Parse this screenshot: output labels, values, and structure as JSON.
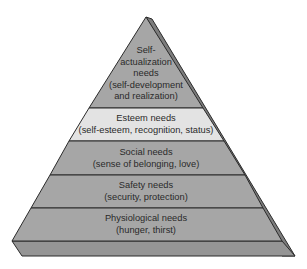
{
  "diagram": {
    "type": "pyramid",
    "colors": {
      "level_fill": "#a6a6a6",
      "esteem_fill": "#e3e3e3",
      "side_face": "#7d7d7d",
      "base_slab": "#959595",
      "outline": "#2b2b2b",
      "text": "#2a2a2a"
    },
    "levels": [
      {
        "name": "self-actualization",
        "lines": [
          "Self-",
          "actualization",
          "needs",
          "(self-development",
          "and realization)"
        ]
      },
      {
        "name": "esteem",
        "lines": [
          "Esteem needs",
          "(self-esteem, recognition, status)"
        ]
      },
      {
        "name": "social",
        "lines": [
          "Social needs",
          "(sense of belonging, love)"
        ]
      },
      {
        "name": "safety",
        "lines": [
          "Safety needs",
          "(security, protection)"
        ]
      },
      {
        "name": "physiological",
        "lines": [
          "Physiological needs",
          "(hunger, thirst)"
        ]
      }
    ]
  }
}
